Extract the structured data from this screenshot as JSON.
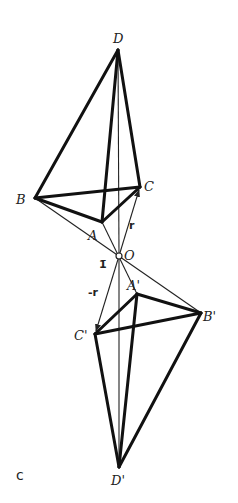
{
  "figure": {
    "panel_label": "c",
    "symmetry_element": "1̄",
    "center": {
      "label": "O",
      "x": 119,
      "y": 256
    },
    "vectors": {
      "r": {
        "label": "r",
        "from": "O",
        "to": "C"
      },
      "minus_r": {
        "label": "-r",
        "from": "O",
        "to": "C'"
      }
    },
    "points": {
      "D": {
        "label": "D",
        "x": 118,
        "y": 50
      },
      "B": {
        "label": "B",
        "x": 35,
        "y": 198
      },
      "C": {
        "label": "C",
        "x": 140,
        "y": 187
      },
      "A": {
        "label": "A",
        "x": 102,
        "y": 222
      },
      "A2": {
        "label": "A'",
        "x": 137,
        "y": 294
      },
      "B2": {
        "label": "B'",
        "x": 201,
        "y": 313
      },
      "C2": {
        "label": "C'",
        "x": 95,
        "y": 334
      },
      "D2": {
        "label": "D'",
        "x": 119,
        "y": 467
      }
    },
    "edges_thick": [
      [
        "B",
        "D"
      ],
      [
        "A",
        "D"
      ],
      [
        "C",
        "D"
      ],
      [
        "B",
        "C"
      ],
      [
        "B",
        "A"
      ],
      [
        "A",
        "C"
      ],
      [
        "A2",
        "C2"
      ],
      [
        "A2",
        "B2"
      ],
      [
        "C2",
        "B2"
      ],
      [
        "C2",
        "D2"
      ],
      [
        "A2",
        "D2"
      ],
      [
        "B2",
        "D2"
      ]
    ],
    "edges_thin": [
      [
        "D",
        "O"
      ],
      [
        "B",
        "O"
      ],
      [
        "A",
        "O"
      ],
      [
        "O",
        "C"
      ],
      [
        "O",
        "D2"
      ],
      [
        "O",
        "B2"
      ],
      [
        "O",
        "A2"
      ],
      [
        "O",
        "C2"
      ]
    ]
  }
}
